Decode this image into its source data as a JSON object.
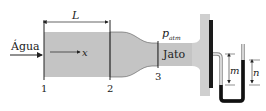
{
  "diagram": {
    "labels": {
      "inlet": "Água",
      "length": "L",
      "axis": "x",
      "section1": "1",
      "section2": "2",
      "section3": "3",
      "pressure": "p",
      "pressure_sub": "atm",
      "jet": "Jato",
      "height_m": "m",
      "height_n": "n"
    },
    "colors": {
      "fluid": "#c4c4c4",
      "plate_back": "#cfcfcf",
      "plate_front": "#1a1a1a",
      "lines": "#222222",
      "manometer_fluid": "#111111"
    }
  }
}
